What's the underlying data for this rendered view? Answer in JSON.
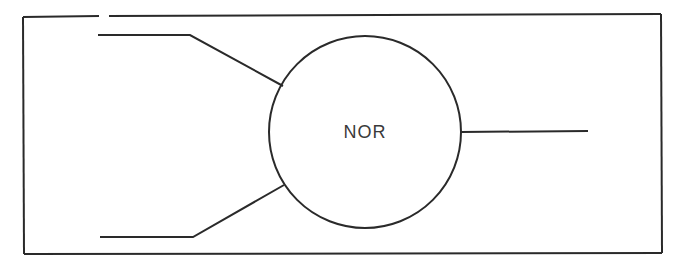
{
  "diagram": {
    "type": "logic-gate",
    "gate": {
      "label": "NOR",
      "shape": "circle"
    },
    "inputs": [
      {
        "name": "input-1"
      },
      {
        "name": "input-2"
      }
    ],
    "outputs": [
      {
        "name": "output"
      }
    ],
    "colors": {
      "line": "#2a2a2a",
      "text": "#3a3a3a",
      "background": "#ffffff"
    }
  }
}
